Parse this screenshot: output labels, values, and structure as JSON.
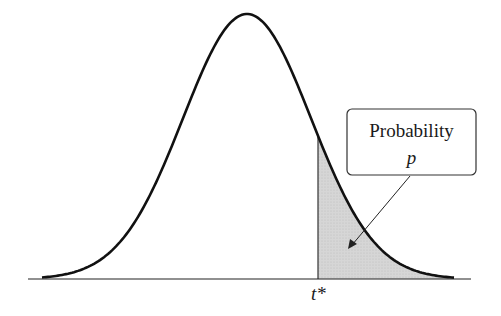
{
  "figure": {
    "type": "t-distribution density curve with shaded upper tail",
    "callout": {
      "title": "Probability",
      "symbol": "p"
    },
    "critical_value_label": "t*",
    "colors": {
      "curve": "#111111",
      "shade": "#d4d4d4",
      "axis": "#222222",
      "background": "#ffffff"
    }
  }
}
